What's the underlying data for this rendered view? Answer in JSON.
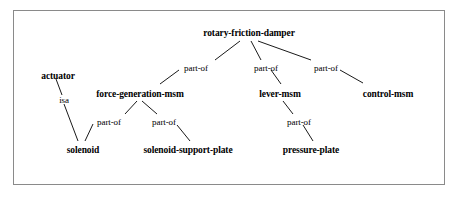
{
  "diagram": {
    "background_color": "#ffffff",
    "frame_color": "#8a8a8a",
    "line_color": "#000000",
    "text_color": "#000000",
    "nodes": [
      {
        "id": "rotary-friction-damper",
        "label": "rotary-friction-damper",
        "x": 249,
        "y": 33
      },
      {
        "id": "actuator",
        "label": "actuator",
        "x": 58,
        "y": 76
      },
      {
        "id": "force-generation-msm",
        "label": "force-generation-msm",
        "x": 140,
        "y": 94
      },
      {
        "id": "lever-msm",
        "label": "lever-msm",
        "x": 280,
        "y": 94
      },
      {
        "id": "control-msm",
        "label": "control-msm",
        "x": 388,
        "y": 94
      },
      {
        "id": "solenoid",
        "label": "solenoid",
        "x": 83,
        "y": 150
      },
      {
        "id": "solenoid-support-plate",
        "label": "solenoid-support-plate",
        "x": 188,
        "y": 150
      },
      {
        "id": "pressure-plate",
        "label": "pressure-plate",
        "x": 311,
        "y": 150
      }
    ],
    "edges": [
      {
        "from": "rotary-friction-damper",
        "to": "force-generation-msm",
        "label": "part-of",
        "label_x": 196,
        "label_y": 68
      },
      {
        "from": "rotary-friction-damper",
        "to": "lever-msm",
        "label": "part-of",
        "label_x": 266,
        "label_y": 68
      },
      {
        "from": "rotary-friction-damper",
        "to": "control-msm",
        "label": "part-of",
        "label_x": 326,
        "label_y": 68
      },
      {
        "from": "actuator",
        "to": "solenoid",
        "label": "isa",
        "label_x": 64,
        "label_y": 100
      },
      {
        "from": "force-generation-msm",
        "to": "solenoid",
        "label": "part-of",
        "label_x": 109,
        "label_y": 122
      },
      {
        "from": "force-generation-msm",
        "to": "solenoid-support-plate",
        "label": "part-of",
        "label_x": 164,
        "label_y": 122
      },
      {
        "from": "lever-msm",
        "to": "pressure-plate",
        "label": "part-of",
        "label_x": 299,
        "label_y": 122
      }
    ]
  }
}
